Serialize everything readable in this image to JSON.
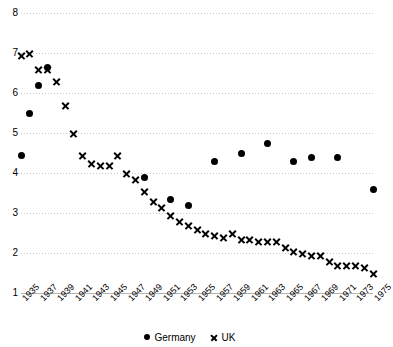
{
  "chart_data": {
    "type": "scatter",
    "title": "",
    "xlabel": "",
    "ylabel": "",
    "xlim": [
      1935,
      1975
    ],
    "ylim": [
      1,
      8
    ],
    "grid": true,
    "legend_position": "bottom-center",
    "y_ticks": [
      8,
      7,
      6,
      5,
      4,
      3,
      2,
      1
    ],
    "x_tick_labels": [
      "1935",
      "1937",
      "1939",
      "1941",
      "1943",
      "1945",
      "1947",
      "1949",
      "1951",
      "1953",
      "1955",
      "1957",
      "1959",
      "1961",
      "1963",
      "1965",
      "1967",
      "1969",
      "1971",
      "1973",
      "1975"
    ],
    "series": [
      {
        "name": "Germany",
        "marker": "circle",
        "color": "#000000",
        "points": [
          {
            "x": 1935,
            "y": 4.45
          },
          {
            "x": 1936,
            "y": 5.5
          },
          {
            "x": 1937,
            "y": 6.2
          },
          {
            "x": 1938,
            "y": 6.65
          },
          {
            "x": 1949,
            "y": 3.9
          },
          {
            "x": 1952,
            "y": 3.35
          },
          {
            "x": 1954,
            "y": 3.2
          },
          {
            "x": 1957,
            "y": 4.3
          },
          {
            "x": 1960,
            "y": 4.5
          },
          {
            "x": 1963,
            "y": 4.75
          },
          {
            "x": 1966,
            "y": 4.3
          },
          {
            "x": 1968,
            "y": 4.4
          },
          {
            "x": 1971,
            "y": 4.4
          },
          {
            "x": 1975,
            "y": 3.6
          }
        ]
      },
      {
        "name": "UK",
        "marker": "x",
        "color": "#000000",
        "points": [
          {
            "x": 1935,
            "y": 6.95
          },
          {
            "x": 1936,
            "y": 7.0
          },
          {
            "x": 1937,
            "y": 6.6
          },
          {
            "x": 1938,
            "y": 6.6
          },
          {
            "x": 1939,
            "y": 6.3
          },
          {
            "x": 1940,
            "y": 5.7
          },
          {
            "x": 1941,
            "y": 5.0
          },
          {
            "x": 1942,
            "y": 4.45
          },
          {
            "x": 1943,
            "y": 4.25
          },
          {
            "x": 1944,
            "y": 4.2
          },
          {
            "x": 1945,
            "y": 4.2
          },
          {
            "x": 1946,
            "y": 4.45
          },
          {
            "x": 1947,
            "y": 4.0
          },
          {
            "x": 1948,
            "y": 3.85
          },
          {
            "x": 1949,
            "y": 3.55
          },
          {
            "x": 1950,
            "y": 3.3
          },
          {
            "x": 1951,
            "y": 3.15
          },
          {
            "x": 1952,
            "y": 2.95
          },
          {
            "x": 1953,
            "y": 2.8
          },
          {
            "x": 1954,
            "y": 2.7
          },
          {
            "x": 1955,
            "y": 2.6
          },
          {
            "x": 1956,
            "y": 2.5
          },
          {
            "x": 1957,
            "y": 2.45
          },
          {
            "x": 1958,
            "y": 2.4
          },
          {
            "x": 1959,
            "y": 2.5
          },
          {
            "x": 1960,
            "y": 2.35
          },
          {
            "x": 1961,
            "y": 2.35
          },
          {
            "x": 1962,
            "y": 2.3
          },
          {
            "x": 1963,
            "y": 2.3
          },
          {
            "x": 1964,
            "y": 2.3
          },
          {
            "x": 1965,
            "y": 2.15
          },
          {
            "x": 1966,
            "y": 2.05
          },
          {
            "x": 1967,
            "y": 2.0
          },
          {
            "x": 1968,
            "y": 1.95
          },
          {
            "x": 1969,
            "y": 1.95
          },
          {
            "x": 1970,
            "y": 1.8
          },
          {
            "x": 1971,
            "y": 1.7
          },
          {
            "x": 1972,
            "y": 1.7
          },
          {
            "x": 1973,
            "y": 1.7
          },
          {
            "x": 1974,
            "y": 1.65
          },
          {
            "x": 1975,
            "y": 1.5
          }
        ]
      }
    ]
  },
  "legend": {
    "entries": [
      {
        "label": "Germany",
        "marker": "circle"
      },
      {
        "label": "UK",
        "marker": "x"
      }
    ]
  }
}
